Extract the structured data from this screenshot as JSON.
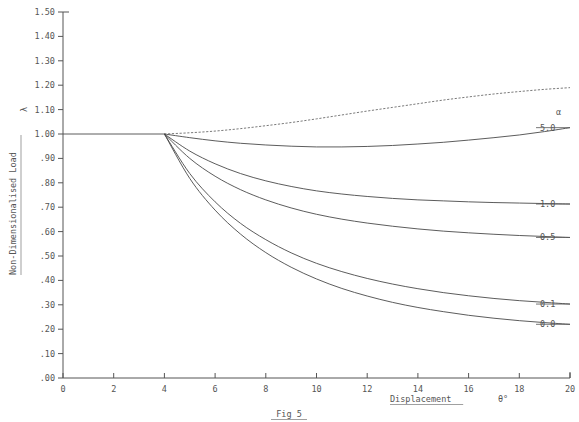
{
  "chart_data": {
    "type": "line",
    "title": "",
    "caption": "Fig 5",
    "xlabel": "Displacement",
    "xunit": "θ°",
    "ylabel": "Non-Dimensionalised Load",
    "ysymbol": "λ",
    "legend_header": "α",
    "legend_position": "right",
    "grid": false,
    "xlim": [
      0,
      20
    ],
    "ylim": [
      0.0,
      1.5
    ],
    "xticks": [
      0,
      2,
      4,
      6,
      8,
      10,
      12,
      14,
      16,
      18,
      20
    ],
    "xtick_labels": [
      "0",
      "2",
      "4",
      "6",
      "8",
      "10",
      "12",
      "14",
      "16",
      "18",
      "20"
    ],
    "yticks": [
      0.0,
      0.1,
      0.2,
      0.3,
      0.4,
      0.5,
      0.6,
      0.7,
      0.8,
      0.9,
      1.0,
      1.1,
      1.2,
      1.3,
      1.4,
      1.5
    ],
    "ytick_labels": [
      ".00",
      ".10",
      ".20",
      ".30",
      ".40",
      ".50",
      ".60",
      ".70",
      ".80",
      ".90",
      "1.00",
      "1.10",
      "1.20",
      "1.30",
      "1.40",
      "1.50"
    ],
    "bifurcation_point": {
      "x": 4.0,
      "y": 1.0
    },
    "prebuckling_path": {
      "x": [
        0,
        4
      ],
      "y": [
        1.0,
        1.0
      ]
    },
    "x": [
      4,
      5,
      6,
      7,
      8,
      9,
      10,
      11,
      12,
      13,
      14,
      15,
      16,
      17,
      18,
      19,
      20
    ],
    "series": [
      {
        "name": "dotted-upper",
        "label": "",
        "style": "dotted",
        "values": [
          1.0,
          1.005,
          1.012,
          1.022,
          1.034,
          1.047,
          1.062,
          1.078,
          1.094,
          1.109,
          1.124,
          1.139,
          1.152,
          1.164,
          1.174,
          1.183,
          1.19
        ]
      },
      {
        "name": "alpha-5.0",
        "label": "5.0",
        "style": "solid",
        "values": [
          1.0,
          0.985,
          0.972,
          0.962,
          0.955,
          0.95,
          0.947,
          0.947,
          0.949,
          0.953,
          0.959,
          0.966,
          0.975,
          0.985,
          0.996,
          1.01,
          1.026
        ]
      },
      {
        "name": "alpha-1.0",
        "label": "1.0",
        "style": "solid",
        "values": [
          1.0,
          0.93,
          0.878,
          0.838,
          0.808,
          0.785,
          0.767,
          0.754,
          0.744,
          0.736,
          0.73,
          0.726,
          0.722,
          0.719,
          0.717,
          0.715,
          0.713
        ]
      },
      {
        "name": "alpha-0.5",
        "label": "0.5",
        "style": "solid",
        "values": [
          1.0,
          0.9,
          0.827,
          0.772,
          0.73,
          0.697,
          0.671,
          0.651,
          0.635,
          0.622,
          0.611,
          0.602,
          0.595,
          0.589,
          0.584,
          0.58,
          0.576
        ]
      },
      {
        "name": "alpha-0.1",
        "label": "0.1",
        "style": "solid",
        "values": [
          1.0,
          0.838,
          0.722,
          0.634,
          0.567,
          0.513,
          0.47,
          0.436,
          0.408,
          0.385,
          0.366,
          0.35,
          0.337,
          0.326,
          0.317,
          0.31,
          0.303
        ]
      },
      {
        "name": "alpha-0.0",
        "label": "0.0",
        "style": "solid",
        "values": [
          1.0,
          0.818,
          0.688,
          0.59,
          0.514,
          0.454,
          0.406,
          0.367,
          0.336,
          0.31,
          0.289,
          0.272,
          0.257,
          0.245,
          0.235,
          0.227,
          0.22
        ]
      }
    ],
    "legend_entries": [
      {
        "label": "5.0",
        "y": 1.026
      },
      {
        "label": "1.0",
        "y": 0.713
      },
      {
        "label": "0.5",
        "y": 0.576
      },
      {
        "label": "0.1",
        "y": 0.303
      },
      {
        "label": "0.0",
        "y": 0.22
      }
    ]
  }
}
